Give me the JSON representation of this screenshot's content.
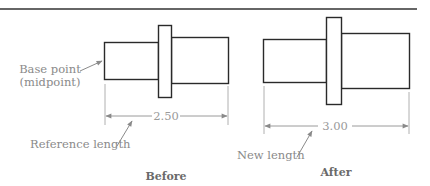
{
  "diagram": {
    "type": "scale-by-reference illustration",
    "colors": {
      "outline": "#2a2a2a",
      "dimension": "#9a9a9a",
      "label_text": "#8a8a8a",
      "caption_text": "#6a6a6a"
    },
    "before": {
      "caption": "Before",
      "dimension_value": "2.50",
      "callouts": {
        "base_point_line1": "Base point",
        "base_point_line2": "(midpoint)",
        "reference_length": "Reference length"
      }
    },
    "after": {
      "caption": "After",
      "dimension_value": "3.00",
      "callouts": {
        "new_length": "New length"
      }
    }
  }
}
